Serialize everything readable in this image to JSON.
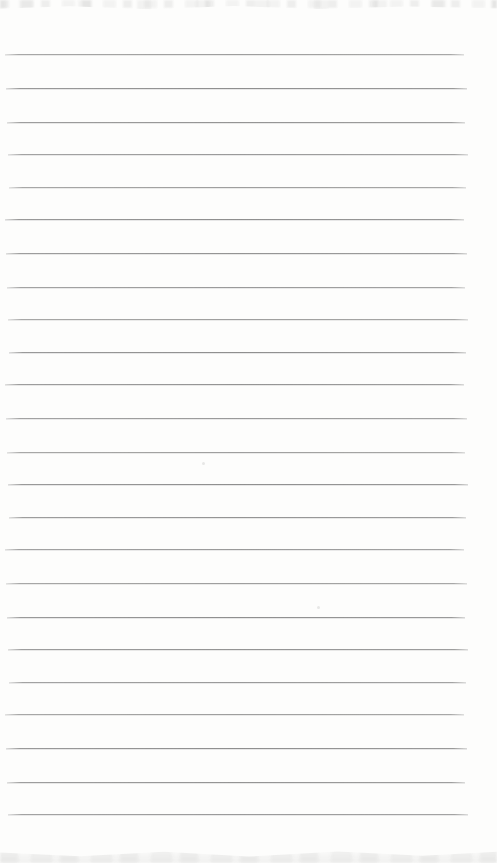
{
  "page": {
    "kind": "blank-ruled-notebook-page",
    "background_color": "#fdfdfc",
    "width": 497,
    "height": 863,
    "text_content": ""
  },
  "ruled_lines": {
    "count": 24,
    "first_y": 55,
    "spacing": 33,
    "left_x": 7,
    "right_x": 466,
    "color": "#8d8d8d"
  },
  "artifacts": {
    "top_band": "faint cut-off text fragments along top edge",
    "bottom_band": "faint mottled scan texture along bottom edge",
    "specks": [
      {
        "x": 202,
        "y": 462
      },
      {
        "x": 317,
        "y": 606
      }
    ]
  }
}
